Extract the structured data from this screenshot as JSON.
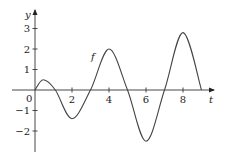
{
  "chart_data": {
    "type": "line",
    "title": "",
    "xlabel": "t",
    "ylabel": "y",
    "curve_label": "f",
    "xlim": [
      0,
      9.6
    ],
    "ylim": [
      -2.8,
      3.4
    ],
    "grid": false,
    "legend": null,
    "x_ticks": [
      2,
      4,
      6,
      8
    ],
    "y_ticks": [
      -2,
      -1,
      1,
      2,
      3
    ],
    "origin_label": "0",
    "series": [
      {
        "name": "f",
        "points": [
          [
            0,
            0
          ],
          [
            0.45,
            0.5
          ],
          [
            1.1,
            0
          ],
          [
            2,
            -1.4
          ],
          [
            3,
            0
          ],
          [
            4,
            2
          ],
          [
            5,
            0
          ],
          [
            6,
            -2.5
          ],
          [
            7,
            0
          ],
          [
            8,
            2.8
          ],
          [
            9,
            0
          ]
        ]
      }
    ]
  },
  "layout": {
    "origin_px": [
      35,
      90
    ],
    "px_per_x": 18.5,
    "px_per_y": 20.5,
    "x_axis_px": [
      12,
      214
    ],
    "y_axis_px": [
      152,
      10
    ]
  }
}
